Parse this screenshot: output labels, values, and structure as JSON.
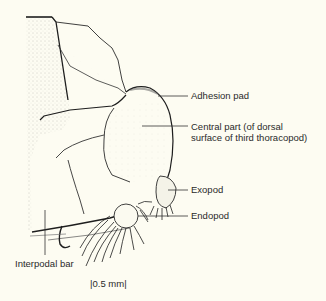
{
  "figure": {
    "labels": {
      "adhesion_pad": "Adhesion pad",
      "central_part_line1": "Central part (of dorsal",
      "central_part_line2": "surface of third thoracopod)",
      "exopod": "Exopod",
      "endopod": "Endopod",
      "interpodal_bar": "Interpodal bar"
    },
    "scale_bar": "|0.5 mm|",
    "colors": {
      "background": "#fdfcf2",
      "ink": "#1e1e1e",
      "stipple": "#9a9a8e"
    }
  }
}
